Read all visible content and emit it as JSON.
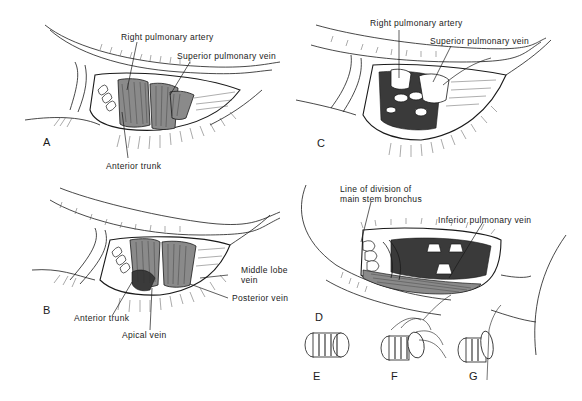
{
  "figure": {
    "panels": [
      {
        "id": "A",
        "letter": "A",
        "labels": [
          "Right pulmonary artery",
          "Superior pulmonary vein",
          "Anterior trunk"
        ]
      },
      {
        "id": "B",
        "letter": "B",
        "labels": [
          "Middle lobe vein",
          "Posterior vein",
          "Anterior trunk",
          "Apical vein"
        ],
        "middle_lobe_line1": "Middle lobe",
        "middle_lobe_line2": "vein"
      },
      {
        "id": "C",
        "letter": "C",
        "labels": [
          "Right pulmonary artery",
          "Superior pulmonary vein"
        ]
      },
      {
        "id": "D",
        "letter": "D",
        "labels": [
          "Line of division of main stem bronchus",
          "Inferior pulmonary vein"
        ],
        "line_division_line1": "Line of division of",
        "line_division_line2": "main stem bronchus"
      },
      {
        "id": "E",
        "letter": "E"
      },
      {
        "id": "F",
        "letter": "F"
      },
      {
        "id": "G",
        "letter": "G"
      }
    ]
  },
  "colors": {
    "ink": "#1a1a1a",
    "background": "#ffffff",
    "tissue_dark": "#3a3a3a",
    "tissue_mid": "#8a8a8a"
  }
}
